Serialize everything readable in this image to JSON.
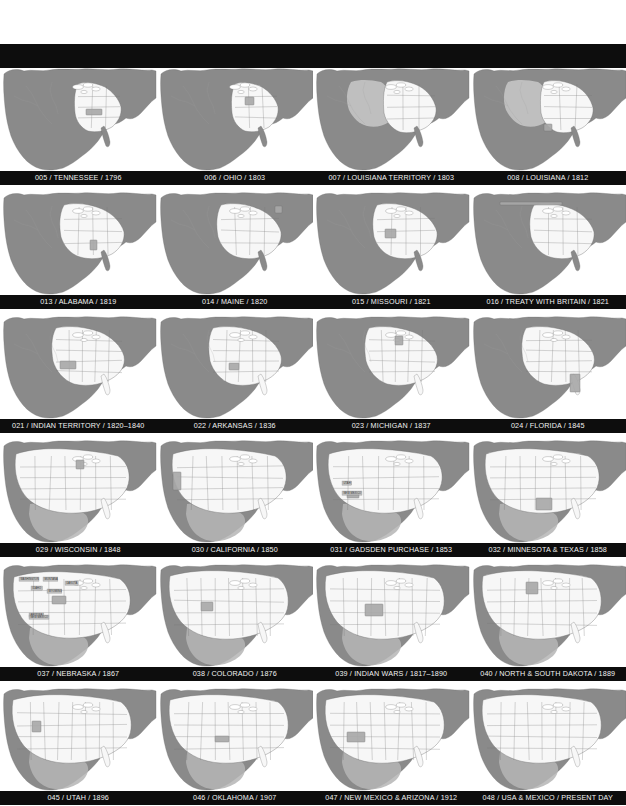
{
  "page": {
    "background_color": "#ffffff",
    "header_bar_color": "#0d0d0d",
    "caption_bar_color": "#0d0d0d",
    "caption_text_color": "#f2f2f2"
  },
  "palette": {
    "unorganized_land": "#8a8a8a",
    "organized_territory": "#b5b5b5",
    "highlight_state": "#a8a8a8",
    "settled_states": "#f7f7f7",
    "water": "#ffffff",
    "border_line": "#777777",
    "coast_line": "#6e6e6e"
  },
  "grid": {
    "columns": 4,
    "rows": 6,
    "total_tiles": 24
  },
  "rows": [
    {
      "index": 1,
      "tiles": [
        {
          "number": "005",
          "name": "TENNESSEE",
          "year": "1796",
          "caption": "005 / TENNESSEE / 1796",
          "style": "early",
          "highlight": "tennessee",
          "labels": []
        },
        {
          "number": "006",
          "name": "OHIO",
          "year": "1803",
          "caption": "006 / OHIO / 1803",
          "style": "early",
          "highlight": "ohio",
          "labels": []
        },
        {
          "number": "007",
          "name": "LOUISIANA TERRITORY",
          "year": "1803",
          "caption": "007 / LOUISIANA TERRITORY / 1803",
          "style": "early-purchase",
          "highlight": "louisiana-purchase",
          "labels": []
        },
        {
          "number": "008",
          "name": "LOUISIANA",
          "year": "1812",
          "caption": "008 / LOUISIANA / 1812",
          "style": "early-purchase",
          "highlight": "louisiana-state",
          "labels": []
        }
      ]
    },
    {
      "index": 2,
      "tiles": [
        {
          "number": "013",
          "name": "ALABAMA",
          "year": "1819",
          "caption": "013 / ALABAMA / 1819",
          "style": "mid",
          "highlight": "alabama",
          "labels": []
        },
        {
          "number": "014",
          "name": "MAINE",
          "year": "1820",
          "caption": "014 / MAINE / 1820",
          "style": "mid",
          "highlight": "maine",
          "labels": []
        },
        {
          "number": "015",
          "name": "MISSOURI",
          "year": "1821",
          "caption": "015 / MISSOURI / 1821",
          "style": "mid",
          "highlight": "missouri",
          "labels": []
        },
        {
          "number": "016",
          "name": "TREATY WITH BRITAIN",
          "year": "1821",
          "caption": "016 / TREATY WITH BRITAIN / 1821",
          "style": "mid",
          "highlight": "northern-border",
          "labels": []
        }
      ]
    },
    {
      "index": 3,
      "tiles": [
        {
          "number": "021",
          "name": "INDIAN TERRITORY",
          "year": "1820–1840",
          "caption": "021 / INDIAN TERRITORY / 1820–1840",
          "style": "mid2",
          "highlight": "indian-territory",
          "labels": []
        },
        {
          "number": "022",
          "name": "ARKANSAS",
          "year": "1836",
          "caption": "022 / ARKANSAS / 1836",
          "style": "mid2",
          "highlight": "arkansas",
          "labels": []
        },
        {
          "number": "023",
          "name": "MICHIGAN",
          "year": "1837",
          "caption": "023 / MICHIGAN / 1837",
          "style": "mid2",
          "highlight": "michigan",
          "labels": []
        },
        {
          "number": "024",
          "name": "FLORIDA",
          "year": "1845",
          "caption": "024 / FLORIDA / 1845",
          "style": "mid2",
          "highlight": "florida",
          "labels": []
        }
      ]
    },
    {
      "index": 4,
      "tiles": [
        {
          "number": "029",
          "name": "WISCONSIN",
          "year": "1848",
          "caption": "029 / WISCONSIN / 1848",
          "style": "late",
          "highlight": "wisconsin",
          "labels": []
        },
        {
          "number": "030",
          "name": "CALIFORNIA",
          "year": "1850",
          "caption": "030 / CALIFORNIA / 1850",
          "style": "late",
          "highlight": "california",
          "labels": []
        },
        {
          "number": "031",
          "name": "GADSDEN PURCHASE",
          "year": "1853",
          "caption": "031 / GADSDEN PURCHASE / 1853",
          "style": "late",
          "highlight": "gadsden",
          "labels": [
            "UTAH",
            "NEW MEXICO"
          ]
        },
        {
          "number": "032",
          "name": "MINNESOTA & TEXAS",
          "year": "1858",
          "caption": "032 / MINNESOTA & TEXAS / 1858",
          "style": "late",
          "highlight": "minnesota-texas",
          "labels": []
        }
      ]
    },
    {
      "index": 5,
      "tiles": [
        {
          "number": "037",
          "name": "NEBRASKA",
          "year": "1867",
          "caption": "037 / NEBRASKA / 1867",
          "style": "territories",
          "highlight": "nebraska",
          "labels": [
            "WASHINGTON",
            "MONTANA",
            "DAKOTA",
            "IDAHO",
            "WYOMING",
            "ARIZONA",
            "NEW MEXICO"
          ]
        },
        {
          "number": "038",
          "name": "COLORADO",
          "year": "1876",
          "caption": "038 / COLORADO / 1876",
          "style": "modern",
          "highlight": "colorado",
          "labels": []
        },
        {
          "number": "039",
          "name": "INDIAN WARS",
          "year": "1817–1890",
          "caption": "039 / INDIAN WARS / 1817–1890",
          "style": "modern",
          "highlight": "indian-wars",
          "labels": []
        },
        {
          "number": "040",
          "name": "NORTH & SOUTH DAKOTA",
          "year": "1889",
          "caption": "040 / NORTH & SOUTH DAKOTA / 1889",
          "style": "modern",
          "highlight": "dakotas",
          "labels": []
        }
      ]
    },
    {
      "index": 6,
      "tiles": [
        {
          "number": "045",
          "name": "UTAH",
          "year": "1896",
          "caption": "045 / UTAH / 1896",
          "style": "modern",
          "highlight": "utah",
          "labels": []
        },
        {
          "number": "046",
          "name": "OKLAHOMA",
          "year": "1907",
          "caption": "046 / OKLAHOMA / 1907",
          "style": "modern",
          "highlight": "oklahoma",
          "labels": []
        },
        {
          "number": "047",
          "name": "NEW MEXICO & ARIZONA",
          "year": "1912",
          "caption": "047 / NEW MEXICO & ARIZONA / 1912",
          "style": "modern",
          "highlight": "nm-az",
          "labels": []
        },
        {
          "number": "048",
          "name": "USA & MEXICO",
          "year": "PRESENT DAY",
          "caption": "048 / USA & MEXICO / PRESENT DAY",
          "style": "modern",
          "highlight": "none",
          "labels": []
        }
      ]
    }
  ]
}
